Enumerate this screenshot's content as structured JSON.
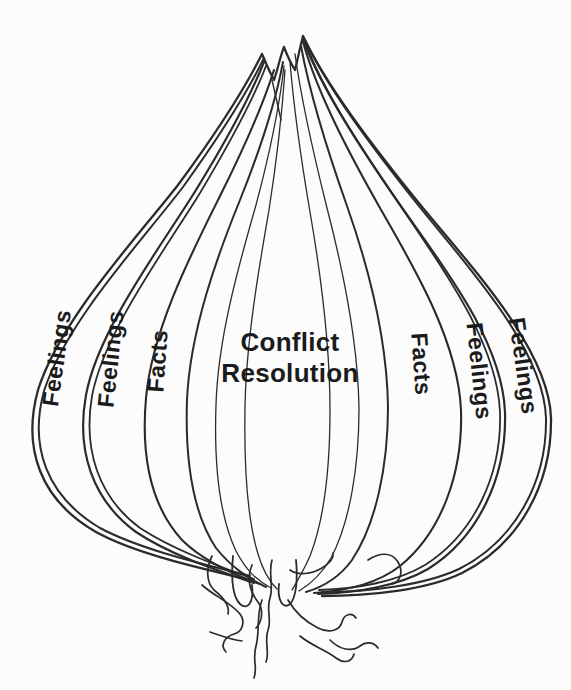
{
  "colors": {
    "paper": "#fcfcfc",
    "line": "#2b2b2b",
    "ink": "#1b1b1b"
  },
  "labels": {
    "left": [
      "Feelings",
      "Feelings",
      "Facts"
    ],
    "center": [
      "Conflict",
      "Resolution"
    ],
    "right": [
      "Facts",
      "Feelings",
      "Feelings"
    ]
  }
}
